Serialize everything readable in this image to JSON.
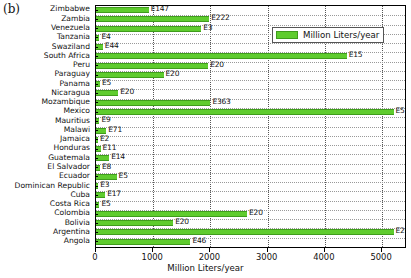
{
  "panel": {
    "label": "(b)"
  },
  "legend": {
    "entries": [
      {
        "name": "Million Liters/year",
        "color": "#5fcc2e"
      }
    ],
    "position": "upper-right"
  },
  "chart_data": {
    "type": "bar",
    "orientation": "horizontal",
    "title": "",
    "subtitle": "",
    "xlabel": "Million Liters/year",
    "ylabel": "",
    "xlim": [
      0,
      5400
    ],
    "ylim": [
      0,
      26
    ],
    "grid": true,
    "xticks": [
      0,
      1000,
      2000,
      3000,
      4000,
      5000
    ],
    "xticklabels": [
      "0",
      "1000",
      "2000",
      "3000",
      "4000",
      "5000"
    ],
    "series_name": "Million Liters/year",
    "color": "#5fcc2e",
    "categories": [
      "Zimbabwe",
      "Zambia",
      "Venezuela",
      "Tanzania",
      "Swaziland",
      "South Africa",
      "Peru",
      "Paraguay",
      "Panama",
      "Nicaragua",
      "Mozambique",
      "Mexico",
      "Mauritius",
      "Malawi",
      "Jamaica",
      "Honduras",
      "Guatemala",
      "El Salvador",
      "Ecuador",
      "Dominican Republic",
      "Cuba",
      "Costa Rica",
      "Colombia",
      "Bolivia",
      "Argentina",
      "Angola"
    ],
    "values": [
      920,
      1980,
      1840,
      60,
      120,
      4380,
      1960,
      1180,
      70,
      390,
      2000,
      5200,
      60,
      180,
      30,
      80,
      230,
      70,
      360,
      40,
      160,
      60,
      2640,
      1350,
      5200,
      1650
    ],
    "point_labels": [
      "E147",
      "E222",
      "E3",
      "E4",
      "E44",
      "E15",
      "E20",
      "E20",
      "E5",
      "E20",
      "E363",
      "E5",
      "E9",
      "E71",
      "E2",
      "E11",
      "E14",
      "E8",
      "E5",
      "E3",
      "E17",
      "E5",
      "E20",
      "E20",
      "E20",
      "E46"
    ]
  }
}
